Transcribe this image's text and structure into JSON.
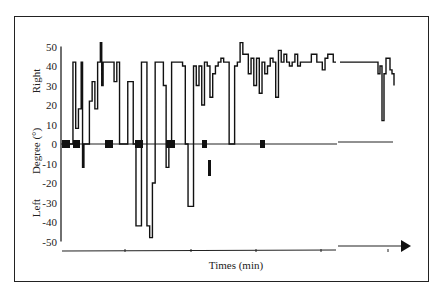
{
  "chart_data": {
    "type": "line",
    "title": "",
    "xlabel": "Times (min)",
    "ylabel": "Degree (°)",
    "ylabel_top": "Right",
    "ylabel_bottom": "Left",
    "ylim": [
      -50,
      50
    ],
    "yticks": [
      50,
      40,
      30,
      20,
      10,
      0,
      -10,
      -20,
      -30,
      -40,
      -50
    ],
    "ytick_labels": [
      "50",
      "40",
      "30",
      "20",
      "10",
      "0",
      "-10",
      "-20",
      "-30",
      "-40",
      "-50"
    ],
    "grid": false,
    "legend": null,
    "x_axis": "arrow, unlabeled ticks",
    "series": [
      {
        "name": "head rotation",
        "segment": 1,
        "x": [
          0,
          2,
          4,
          5,
          6,
          7,
          7.5,
          8,
          9,
          10,
          11,
          12,
          13,
          14,
          14.5,
          15,
          16,
          17,
          18,
          19,
          20,
          21,
          22,
          23,
          24,
          25,
          26,
          27,
          28,
          29,
          30,
          31,
          32,
          33,
          34,
          35,
          36,
          37,
          38,
          39,
          40,
          41,
          42,
          43,
          44,
          45,
          46,
          47,
          48,
          49,
          50,
          51,
          52,
          53,
          54,
          55,
          56,
          57,
          58,
          59,
          60,
          61,
          62,
          63,
          64,
          65,
          66,
          67,
          68,
          69,
          70,
          71,
          72,
          73,
          74,
          75,
          76,
          77,
          78,
          79,
          80,
          81,
          82,
          83,
          84,
          85,
          86,
          87,
          88,
          89,
          90,
          91,
          92,
          93,
          94,
          95,
          96,
          97,
          98,
          99,
          100
        ],
        "y": [
          0,
          0,
          42,
          8,
          18,
          42,
          -12,
          0,
          0,
          22,
          32,
          18,
          42,
          52,
          30,
          42,
          42,
          42,
          42,
          32,
          42,
          0,
          0,
          0,
          32,
          32,
          0,
          -42,
          -42,
          42,
          42,
          -42,
          -48,
          -20,
          42,
          42,
          42,
          30,
          -12,
          0,
          42,
          42,
          42,
          42,
          40,
          0,
          -32,
          -32,
          40,
          30,
          40,
          20,
          42,
          40,
          24,
          36,
          40,
          42,
          44,
          42,
          42,
          0,
          0,
          40,
          42,
          52,
          46,
          46,
          36,
          44,
          30,
          44,
          26,
          42,
          36,
          40,
          44,
          42,
          24,
          48,
          42,
          46,
          42,
          40,
          42,
          46,
          40,
          42,
          42,
          42,
          42,
          46,
          46,
          42,
          42,
          38,
          44,
          46,
          46,
          42,
          42
        ]
      },
      {
        "name": "head rotation (continued)",
        "segment": 2,
        "x": [
          0,
          10,
          20,
          30,
          35,
          38,
          40,
          42,
          44,
          46,
          48,
          50,
          52,
          54
        ],
        "y": [
          42,
          42,
          42,
          42,
          42,
          36,
          40,
          12,
          36,
          44,
          44,
          38,
          36,
          30
        ]
      }
    ]
  }
}
